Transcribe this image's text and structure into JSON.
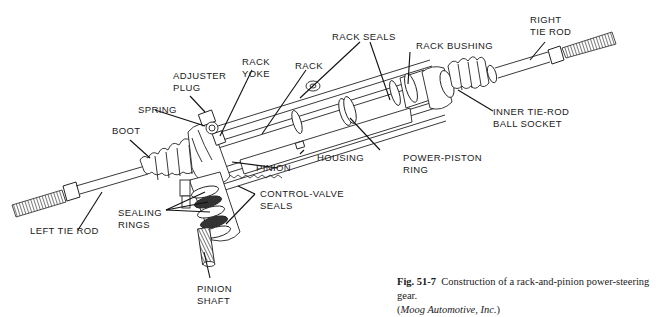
{
  "figure": {
    "number": "Fig. 51-7",
    "title": "Construction of a rack-and-pinion power-steering gear.",
    "credit_open": "(",
    "credit": "Moog Automotive, Inc.",
    "credit_close": ")"
  },
  "labels": {
    "right_tie_rod": "RIGHT\nTIE ROD",
    "rack_seals": "RACK SEALS",
    "rack_bushing": "RACK BUSHING",
    "inner_tie_rod": "INNER TIE-ROD\nBALL SOCKET",
    "rack_yoke": "RACK\nYOKE",
    "rack": "RACK",
    "adjuster_plug": "ADJUSTER\nPLUG",
    "spring": "SPRING",
    "boot": "BOOT",
    "housing": "HOUSING",
    "power_piston_ring": "POWER-PISTON\nRING",
    "pinion": "PINION",
    "control_valve_seals": "CONTROL-VALVE\nSEALS",
    "sealing_rings": "SEALING\nRINGS",
    "left_tie_rod": "LEFT TIE ROD",
    "pinion_shaft": "PINION\nSHAFT"
  },
  "colors": {
    "ink": "#1a1a1a",
    "background": "#ffffff"
  }
}
